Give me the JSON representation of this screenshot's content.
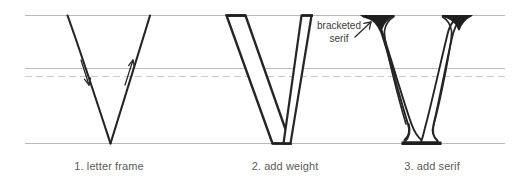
{
  "figure": {
    "background_color": "#ffffff",
    "guideline_color": "#b9b9b9",
    "dashed_guideline_color": "#c9c9c9",
    "stroke_color": "#1f1f1f",
    "construction_line_color": "#c4c4c4",
    "caption_color": "#5b5b5b",
    "annotation_color": "#3a3a3a",
    "guidelines": [
      {
        "name": "cap-height",
        "y": 15,
        "style": "solid"
      },
      {
        "name": "x-height",
        "y": 68,
        "style": "solid"
      },
      {
        "name": "midline",
        "y": 76,
        "style": "dashed"
      },
      {
        "name": "baseline",
        "y": 143,
        "style": "solid"
      }
    ],
    "guideline_extent": {
      "x_start": 25,
      "x_end": 505
    }
  },
  "panels": [
    {
      "index": 1,
      "caption": "1. letter frame",
      "description": "skeleton V drawn with single pencil strokes",
      "arrows": [
        {
          "name": "downstroke-arrow",
          "direction": "down-right"
        },
        {
          "name": "upstroke-arrow",
          "direction": "up-right"
        }
      ]
    },
    {
      "index": 2,
      "caption": "2. add weight",
      "description": "V outlined with a thick left stem and thin right stem over faint construction lines"
    },
    {
      "index": 3,
      "caption": "3. add serif",
      "description": "weighted V finished with flared bracketed serifs at top and foot"
    }
  ],
  "annotations": [
    {
      "name": "bracketed-serif",
      "line1": "bracketed",
      "line2": "serif",
      "points_to": "top-left serif of panel 3"
    }
  ]
}
